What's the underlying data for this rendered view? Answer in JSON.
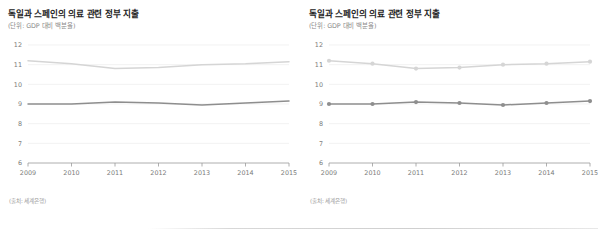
{
  "panels": [
    {
      "id": "left",
      "title": "독일과 스페인의 의료 관련 정부 지출",
      "subtitle": "(단위: GDP 대비 백분율)",
      "source": "(출처: 세계은행)",
      "markers": false
    },
    {
      "id": "right",
      "title": "독일과 스페인의 의료 관련 정부 지출",
      "subtitle": "(단위: GDP 대비 백분율)",
      "source": "(출처: 세계은행)",
      "markers": true
    }
  ],
  "chart_data": [
    {
      "type": "line",
      "title": "독일과 스페인의 의료 관련 정부 지출",
      "subtitle": "(단위: GDP 대비 백분율)",
      "xlabel": "",
      "ylabel": "(단위: GDP 대비 백분율)",
      "x": [
        "2009",
        "2010",
        "2011",
        "2012",
        "2013",
        "2014",
        "2015"
      ],
      "ylim": [
        6,
        12
      ],
      "yticks": [
        6,
        7,
        8,
        9,
        10,
        11,
        12
      ],
      "grid": true,
      "legend": "none",
      "markers": false,
      "series": [
        {
          "name": "독일",
          "color": "#d5d5d5",
          "values": [
            11.2,
            11.05,
            10.8,
            10.85,
            11.0,
            11.05,
            11.15
          ]
        },
        {
          "name": "스페인",
          "color": "#8e8e8e",
          "values": [
            9.0,
            9.0,
            9.1,
            9.05,
            8.95,
            9.05,
            9.15
          ]
        }
      ],
      "source": "(출처: 세계은행)"
    },
    {
      "type": "line",
      "title": "독일과 스페인의 의료 관련 정부 지출",
      "subtitle": "(단위: GDP 대비 백분율)",
      "xlabel": "",
      "ylabel": "(단위: GDP 대비 백분율)",
      "x": [
        "2009",
        "2010",
        "2011",
        "2012",
        "2013",
        "2014",
        "2015"
      ],
      "ylim": [
        6,
        12
      ],
      "yticks": [
        6,
        7,
        8,
        9,
        10,
        11,
        12
      ],
      "grid": true,
      "legend": "none",
      "markers": true,
      "series": [
        {
          "name": "독일",
          "color": "#d5d5d5",
          "values": [
            11.2,
            11.05,
            10.8,
            10.85,
            11.0,
            11.05,
            11.15
          ]
        },
        {
          "name": "스페인",
          "color": "#8e8e8e",
          "values": [
            9.0,
            9.0,
            9.1,
            9.05,
            8.95,
            9.05,
            9.15
          ]
        }
      ],
      "source": "(출처: 세계은행)"
    }
  ],
  "colors": {
    "series_light": "#d5d5d5",
    "series_dark": "#8e8e8e",
    "grid": "#ededed",
    "axis": "#9a9a9a",
    "tick_text": "#7b7b7b",
    "title": "#222222",
    "subtitle": "#8a8a8a"
  }
}
